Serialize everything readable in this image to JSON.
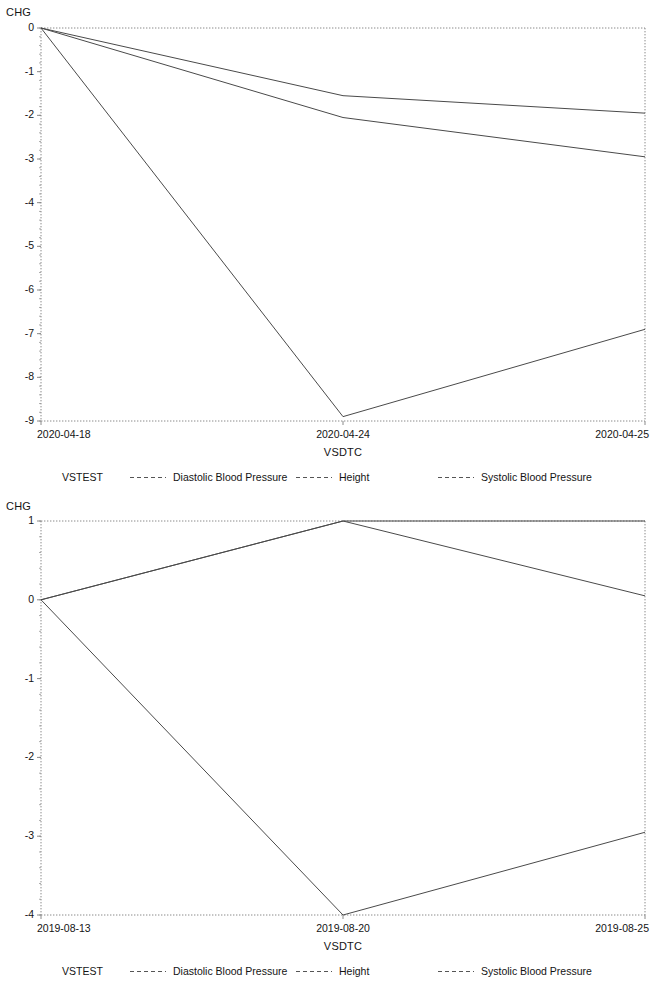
{
  "charts": [
    {
      "name": "chart-top",
      "ylabel": "CHG",
      "xlabel": "VSDTC",
      "yticks": [
        "0",
        "-1",
        "-2",
        "-3",
        "-4",
        "-5",
        "-6",
        "-7",
        "-8",
        "-9"
      ],
      "ytick_values": [
        0,
        -1,
        -2,
        -3,
        -4,
        -5,
        -6,
        -7,
        -8,
        -9
      ],
      "xticks": [
        "2020-04-18",
        "2020-04-24",
        "2020-04-25"
      ],
      "legend_title": "VSTEST",
      "legend": [
        "Diastolic Blood Pressure",
        "Height",
        "Systolic Blood Pressure"
      ]
    },
    {
      "name": "chart-bottom",
      "ylabel": "CHG",
      "xlabel": "VSDTC",
      "yticks": [
        "1",
        "0",
        "-1",
        "-2",
        "-3",
        "-4"
      ],
      "ytick_values": [
        1,
        0,
        -1,
        -2,
        -3,
        -4
      ],
      "xticks": [
        "2019-08-13",
        "2019-08-20",
        "2019-08-25"
      ],
      "legend_title": "VSTEST",
      "legend": [
        "Diastolic Blood Pressure",
        "Height",
        "Systolic Blood Pressure"
      ]
    }
  ],
  "chart_data": [
    {
      "type": "line",
      "title": "",
      "xlabel": "VSDTC",
      "ylabel": "CHG",
      "x": [
        "2020-04-18",
        "2020-04-24",
        "2020-04-25"
      ],
      "ylim": [
        -9,
        0
      ],
      "yticks": [
        0,
        -1,
        -2,
        -3,
        -4,
        -5,
        -6,
        -7,
        -8,
        -9
      ],
      "grid": false,
      "legend_position": "bottom",
      "legend_title": "VSTEST",
      "series": [
        {
          "name": "Diastolic Blood Pressure",
          "values": [
            0,
            -2.05,
            -2.95
          ]
        },
        {
          "name": "Height",
          "values": [
            0,
            -1.55,
            -1.95
          ]
        },
        {
          "name": "Systolic Blood Pressure",
          "values": [
            0,
            -8.9,
            -6.9
          ]
        }
      ]
    },
    {
      "type": "line",
      "title": "",
      "xlabel": "VSDTC",
      "ylabel": "CHG",
      "x": [
        "2019-08-13",
        "2019-08-20",
        "2019-08-25"
      ],
      "ylim": [
        -4,
        1
      ],
      "yticks": [
        1,
        0,
        -1,
        -2,
        -3,
        -4
      ],
      "grid": false,
      "legend_position": "bottom",
      "legend_title": "VSTEST",
      "series": [
        {
          "name": "Diastolic Blood Pressure",
          "values": [
            0,
            1.0,
            1.0
          ]
        },
        {
          "name": "Height",
          "values": [
            0,
            1.0,
            0.05
          ]
        },
        {
          "name": "Systolic Blood Pressure",
          "values": [
            0,
            -4.0,
            -2.95
          ]
        }
      ]
    }
  ],
  "colors": {
    "line": "#4a4a4a",
    "axis": "#8a8a8a",
    "text": "#141414",
    "background": "#ffffff"
  }
}
